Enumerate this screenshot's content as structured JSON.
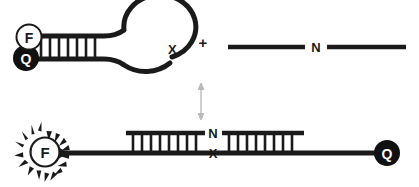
{
  "figure": {
    "colors": {
      "ink": "#1a1a1a",
      "background": "#ffffff",
      "quencher_fill": "#111111",
      "fluorophore_fill": "#ffffff",
      "arrow_faint": "#b9b9b9"
    },
    "top_row": {
      "beacon": {
        "fluorophore_label": "F",
        "quencher_label": "Q",
        "loop_end_label": "X",
        "stem_rungs": 7
      },
      "plus_sign": "+",
      "target_strand": {
        "label": "N"
      }
    },
    "equilibrium_arrow": {
      "name": "double-headed-vertical-arrow"
    },
    "bottom_row": {
      "fluorophore_label": "F",
      "fluorescing": true,
      "junction_top_label": "N",
      "junction_bottom_label": "X",
      "left_duplex_rungs": 8,
      "right_duplex_rungs": 8,
      "quencher_label": "Q"
    }
  }
}
